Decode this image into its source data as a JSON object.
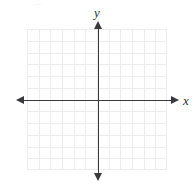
{
  "figure": {
    "kind": "cartesian-coordinate-plane",
    "background_color": "#ffffff",
    "top_artifact_text": "—  —    y    —  —"
  },
  "axes": {
    "x_label": "x",
    "y_label": "y",
    "axis_color": "#3a3a3c",
    "origin_px": {
      "x": 98,
      "y": 100
    },
    "x_axis": {
      "name": "x-axis",
      "start_px": 18,
      "end_px": 179,
      "arrow_left": true,
      "arrow_right": true
    },
    "y_axis": {
      "name": "y-axis",
      "start_px": 21,
      "end_px": 181,
      "arrow_up": true,
      "arrow_down": true
    }
  },
  "grid": {
    "color": "#ececed",
    "columns": 12,
    "rows": 12,
    "left_px": 27,
    "top_px": 29,
    "width_px": 140,
    "height_px": 141,
    "tick_labels_visible": false
  },
  "chart_data": {
    "type": "scatter",
    "title": "",
    "subtitle": "",
    "xlabel": "x",
    "ylabel": "y",
    "xlim": [
      -6,
      6
    ],
    "ylim": [
      -6,
      6
    ],
    "xticks": [
      -6,
      -5,
      -4,
      -3,
      -2,
      -1,
      0,
      1,
      2,
      3,
      4,
      5,
      6
    ],
    "yticks": [
      -6,
      -5,
      -4,
      -3,
      -2,
      -1,
      0,
      1,
      2,
      3,
      4,
      5,
      6
    ],
    "xticklabels": [
      "",
      "",
      "",
      "",
      "",
      "",
      "",
      "",
      "",
      "",
      "",
      "",
      ""
    ],
    "yticklabels": [
      "",
      "",
      "",
      "",
      "",
      "",
      "",
      "",
      "",
      "",
      "",
      "",
      ""
    ],
    "grid": true,
    "legend": false,
    "legend_position": "none",
    "annotations": [],
    "series": [
      {
        "name": "empty",
        "x": [],
        "y": []
      }
    ]
  }
}
